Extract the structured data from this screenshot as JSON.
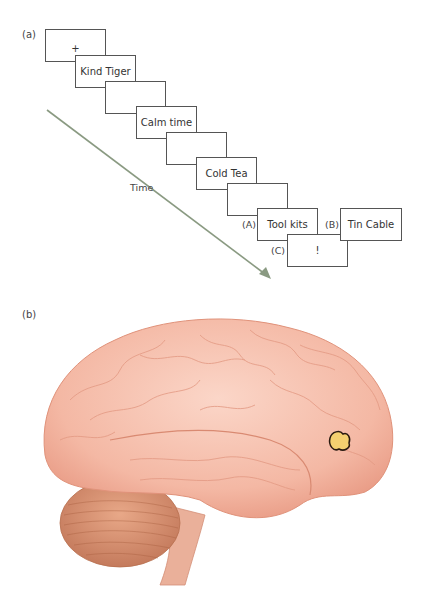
{
  "panel_a": {
    "label": "(a)",
    "time_label": "Time",
    "sequence": [
      {
        "text": "+"
      },
      {
        "text": "Kind Tiger"
      },
      {
        "text": ""
      },
      {
        "text": "Calm time"
      },
      {
        "text": ""
      },
      {
        "text": "Cold Tea"
      },
      {
        "text": ""
      },
      {
        "text": "Tool kits"
      }
    ],
    "conditions": {
      "A": {
        "label": "(A)",
        "text": "Tool kits"
      },
      "B": {
        "label": "(B)",
        "text": "Tin Cable"
      },
      "C": {
        "label": "(C)",
        "text": "!"
      }
    },
    "arrow_color": "#8a9a82"
  },
  "panel_b": {
    "label": "(b)",
    "image": "brain-lateral-view",
    "highlight": "frontal-activation-spot",
    "brain_color": "#f4b8a4",
    "highlight_color": "#f5d070"
  }
}
